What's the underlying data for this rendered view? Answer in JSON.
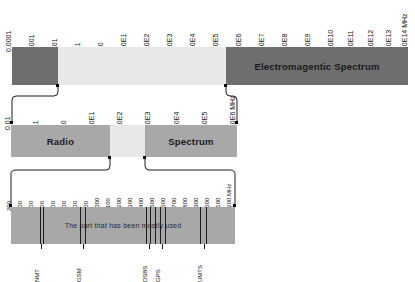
{
  "diagram": {
    "colors": {
      "dark_bar": "#6e6e6e",
      "mid_bar": "#a8a8a8",
      "light_bar": "#e8e8e8",
      "line": "#1c1c1c",
      "text": "#111111"
    }
  },
  "row_top": {
    "band_label": "Electromagentic Spectrum",
    "unit": "MHz",
    "ticks": [
      {
        "label": "0.0001",
        "x": 12
      },
      {
        "label": "0.001",
        "x": 35
      },
      {
        "label": "0.01",
        "x": 58
      },
      {
        "label": "0.1",
        "x": 81
      },
      {
        "label": "1.0",
        "x": 104
      },
      {
        "label": "1.0E1",
        "x": 127
      },
      {
        "label": "1.0E2",
        "x": 150
      },
      {
        "label": "1.0E3",
        "x": 173
      },
      {
        "label": "1.0E4",
        "x": 196
      },
      {
        "label": "1.0E5",
        "x": 219
      },
      {
        "label": "1.0E6",
        "x": 242
      },
      {
        "label": "1.0E7",
        "x": 265
      },
      {
        "label": "1.0E8",
        "x": 288
      },
      {
        "label": "1.0E9",
        "x": 311
      },
      {
        "label": "1.0E10",
        "x": 334
      },
      {
        "label": "1.0E11",
        "x": 354
      },
      {
        "label": "1.0E12",
        "x": 374
      },
      {
        "label": "1.0E13",
        "x": 392
      },
      {
        "label": "1.0E14 MHz",
        "x": 408
      }
    ]
  },
  "row_mid": {
    "left_label": "Radio",
    "right_label": "Spectrum",
    "ticks": [
      {
        "label": "0.01",
        "x": 11
      },
      {
        "label": "0.1",
        "x": 39
      },
      {
        "label": "1.0",
        "x": 67
      },
      {
        "label": "1.0E1",
        "x": 95
      },
      {
        "label": "1.0E2",
        "x": 123
      },
      {
        "label": "1.0E3",
        "x": 151
      },
      {
        "label": "1.0E4",
        "x": 180
      },
      {
        "label": "1.0E5",
        "x": 208
      },
      {
        "label": "1.0E6 MHz",
        "x": 236
      }
    ]
  },
  "row_bottom": {
    "band_label": "The part that has been mostly used",
    "ticks": [
      {
        "label": "200",
        "x": 12
      },
      {
        "label": "300",
        "x": 23
      },
      {
        "label": "400",
        "x": 34
      },
      {
        "label": "500",
        "x": 45
      },
      {
        "label": "600",
        "x": 56
      },
      {
        "label": "700",
        "x": 67
      },
      {
        "label": "800",
        "x": 78
      },
      {
        "label": "900",
        "x": 89
      },
      {
        "label": "1000",
        "x": 100
      },
      {
        "label": "1100",
        "x": 111
      },
      {
        "label": "1200",
        "x": 122
      },
      {
        "label": "1300",
        "x": 133
      },
      {
        "label": "1400",
        "x": 144
      },
      {
        "label": "1500",
        "x": 155
      },
      {
        "label": "1600",
        "x": 166
      },
      {
        "label": "1700",
        "x": 177
      },
      {
        "label": "1800",
        "x": 188
      },
      {
        "label": "1900",
        "x": 199
      },
      {
        "label": "2000",
        "x": 210
      },
      {
        "label": "2100",
        "x": 221
      },
      {
        "label": "2200 MHz",
        "x": 232
      }
    ],
    "services": [
      {
        "label": "NMT",
        "x": 40
      },
      {
        "label": "GSM",
        "x": 82
      },
      {
        "label": "DSBS",
        "x": 148
      },
      {
        "label": "GPS",
        "x": 161
      },
      {
        "label": "UMTS",
        "x": 203
      }
    ],
    "marker_lines": [
      40,
      43,
      80,
      85,
      146,
      150,
      155,
      160,
      165,
      200,
      206
    ]
  }
}
